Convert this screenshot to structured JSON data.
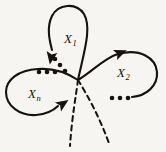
{
  "figure": {
    "kind": "wedge-of-circles-diagram",
    "background_color": "#f7f5f1",
    "ink_color": "#16120f",
    "basepoint": {
      "x": 78,
      "y": 80
    },
    "labels": [
      {
        "id": "x1",
        "base": "X",
        "subscript": "1",
        "x": 64,
        "y": 32
      },
      {
        "id": "x2",
        "base": "X",
        "subscript": "2",
        "x": 117,
        "y": 66
      },
      {
        "id": "xn",
        "base": "X",
        "subscript": "n",
        "x": 28,
        "y": 87
      }
    ],
    "loops": [
      {
        "id": "loop-x1",
        "label": "X1",
        "style": "solid",
        "orientation": "counterclockwise",
        "path": "M 78 80 C 84 52 92 28 84 14 C 76 2 58 4 52 16 C 46 28 50 42 52 50"
      },
      {
        "id": "loop-x2",
        "label": "X2",
        "style": "solid",
        "orientation": "counterclockwise",
        "path": "M 78 80 C 92 72 104 58 118 54 C 140 48 156 58 157 72 C 158 86 146 96 132 97"
      },
      {
        "id": "loop-xn",
        "label": "Xn",
        "style": "solid",
        "orientation": "clockwise",
        "path": "M 78 80 C 66 72 52 68 38 69 C 18 70 6 80 6 92 C 6 106 20 116 36 115 C 46 114 54 110 58 106"
      }
    ],
    "dashed_curves": [
      {
        "id": "dashed-left",
        "style": "dashed",
        "path": "M 78 80 C 76 96 72 116 70 146"
      },
      {
        "id": "dashed-right",
        "style": "dashed",
        "path": "M 78 80 C 88 96 100 118 110 146"
      }
    ],
    "arrows": [
      {
        "id": "arrow-x1",
        "on": "loop-x1",
        "x": 52,
        "y": 52,
        "angle": 100,
        "direction": "down"
      },
      {
        "id": "arrow-x2",
        "on": "loop-x2",
        "x": 115,
        "y": 55,
        "angle": -22,
        "direction": "up-right"
      },
      {
        "id": "arrow-xn",
        "on": "loop-xn",
        "x": 58,
        "y": 107,
        "angle": -34,
        "direction": "right-up"
      }
    ],
    "ellipses": [
      {
        "id": "ellipsis-x1-xn",
        "orientation": "diagonal",
        "dots": [
          {
            "x": 55,
            "y": 59,
            "r": 2.3
          },
          {
            "x": 60,
            "y": 65,
            "r": 2.3
          },
          {
            "x": 65,
            "y": 71,
            "r": 2.3
          }
        ]
      },
      {
        "id": "ellipsis-xn-top",
        "orientation": "horizontal",
        "dots": [
          {
            "x": 39,
            "y": 72,
            "r": 2.3
          },
          {
            "x": 47,
            "y": 72,
            "r": 2.3
          },
          {
            "x": 55,
            "y": 72,
            "r": 2.3
          }
        ]
      },
      {
        "id": "ellipsis-x2-bottom",
        "orientation": "horizontal",
        "dots": [
          {
            "x": 112,
            "y": 98,
            "r": 2.3
          },
          {
            "x": 120,
            "y": 98,
            "r": 2.3
          },
          {
            "x": 128,
            "y": 98,
            "r": 2.3
          }
        ]
      }
    ]
  }
}
